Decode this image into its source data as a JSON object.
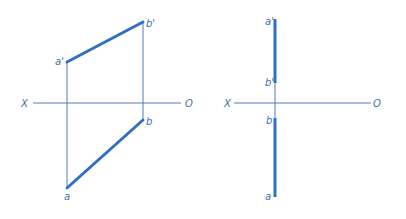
{
  "colors": {
    "line": "#2f6fc4",
    "thin": "#4a7cc0",
    "label": "#3a6fb0"
  },
  "left_view": {
    "axis": {
      "x_label": "X",
      "o_label": "O"
    },
    "points": {
      "a_prime": "a'",
      "b_prime": "b'",
      "a": "a",
      "b": "b"
    }
  },
  "right_view": {
    "axis": {
      "x_label": "X",
      "o_label": "O"
    },
    "points": {
      "a_prime": "a'",
      "b_prime": "b'",
      "a": "a",
      "b": "b"
    }
  }
}
